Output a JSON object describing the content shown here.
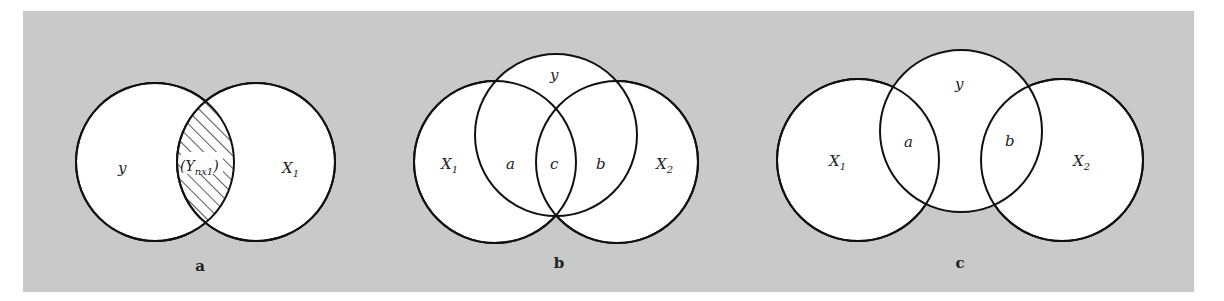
{
  "figure": {
    "background_color": "#c9c9c9",
    "circle_fill": "#ffffff",
    "stroke_color": "#111111",
    "panels": [
      {
        "caption": "a",
        "circles": [
          {
            "label": "y",
            "sub": ""
          },
          {
            "label": "X",
            "sub": "1"
          }
        ],
        "overlap_label": "(Y",
        "overlap_sub": "nx1",
        "overlap_close": ")",
        "overlap_hatched": true
      },
      {
        "caption": "b",
        "circles": [
          {
            "label": "X",
            "sub": "1"
          },
          {
            "label": "y",
            "sub": ""
          },
          {
            "label": "X",
            "sub": "2"
          }
        ],
        "regions": [
          "a",
          "c",
          "b"
        ]
      },
      {
        "caption": "c",
        "circles": [
          {
            "label": "X",
            "sub": "1"
          },
          {
            "label": "y",
            "sub": ""
          },
          {
            "label": "X",
            "sub": "2"
          }
        ],
        "regions": [
          "a",
          "b"
        ]
      }
    ]
  }
}
